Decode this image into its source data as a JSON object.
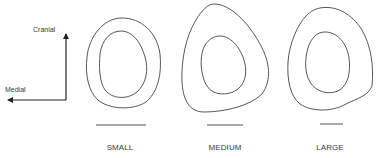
{
  "orientation": {
    "vertical_label": "Cranial",
    "horizontal_label": "Medial"
  },
  "sections": [
    {
      "label": "SMALL",
      "scale_bar_length_px": 50
    },
    {
      "label": "MEDIUM",
      "scale_bar_length_px": 36
    },
    {
      "label": "LARGE",
      "scale_bar_length_px": 23
    }
  ],
  "colors": {
    "stroke": "#444444",
    "background": "#ffffff"
  }
}
